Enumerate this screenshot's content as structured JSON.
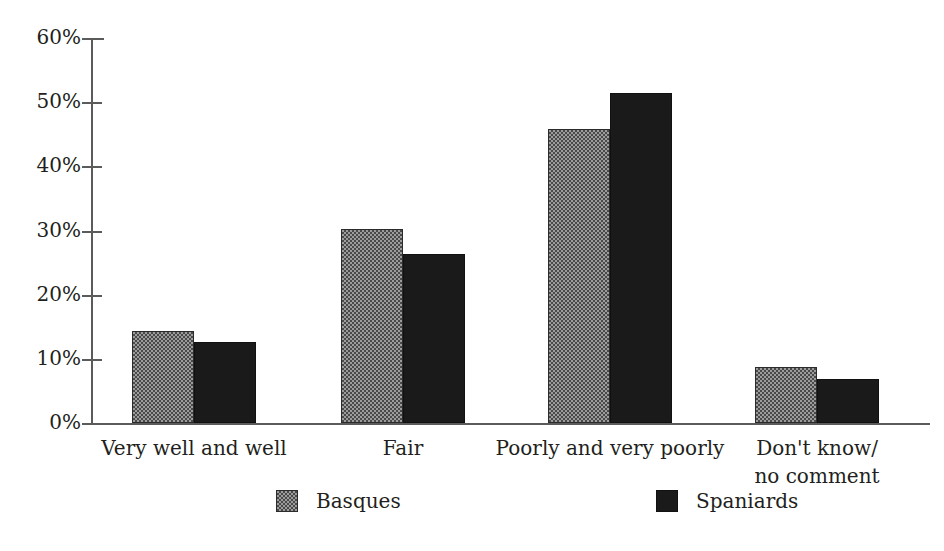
{
  "chart_data": {
    "type": "bar",
    "title": "",
    "subtitle": "",
    "xlabel": "",
    "ylabel": "",
    "ylim": [
      0,
      60
    ],
    "ytick_values": [
      0,
      10,
      20,
      30,
      40,
      50,
      60
    ],
    "ytick_labels": [
      "0%",
      "10%",
      "20%",
      "30%",
      "40%",
      "50%",
      "60%"
    ],
    "grid": false,
    "legend_position": "bottom",
    "categories": [
      "Very well and well",
      "Fair",
      "Poorly and very poorly",
      "Don't know/\nno comment"
    ],
    "series": [
      {
        "name": "Basques",
        "color": "#9c9c9c",
        "values": [
          14.4,
          30.3,
          45.8,
          8.7
        ]
      },
      {
        "name": "Spaniards",
        "color": "#1a1a1a",
        "values": [
          12.6,
          26.4,
          51.5,
          6.8
        ]
      }
    ]
  },
  "legend": {
    "items": [
      {
        "label": "Basques",
        "swatch": "basques-swatch"
      },
      {
        "label": "Spaniards",
        "swatch": "spaniards-swatch"
      }
    ]
  },
  "axis": {
    "y_ticks": [
      {
        "label": "60%",
        "value": 60
      },
      {
        "label": "50%",
        "value": 50
      },
      {
        "label": "40%",
        "value": 40
      },
      {
        "label": "30%",
        "value": 30
      },
      {
        "label": "20%",
        "value": 20
      },
      {
        "label": "10%",
        "value": 10
      },
      {
        "label": "0%",
        "value": 0
      }
    ]
  }
}
